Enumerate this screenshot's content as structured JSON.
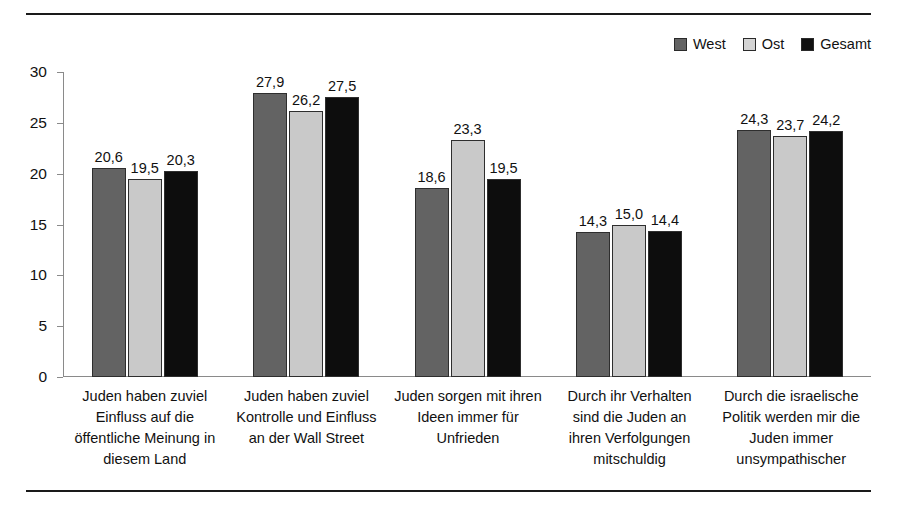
{
  "legend": {
    "position": "top-right",
    "entries": [
      {
        "label": "West",
        "color": "#636363",
        "name": "legend-west"
      },
      {
        "label": "Ost",
        "color": "#d4d4d4",
        "name": "legend-ost"
      },
      {
        "label": "Gesamt",
        "color": "#111111",
        "name": "legend-gesamt"
      }
    ]
  },
  "axis": {
    "y_ticks": [
      "0",
      "5",
      "10",
      "15",
      "20",
      "25",
      "30"
    ]
  },
  "chart_data": {
    "type": "bar",
    "title": "",
    "xlabel": "",
    "ylabel": "",
    "ylim": [
      0,
      30
    ],
    "ytick_step": 5,
    "grid": false,
    "legend_position": "top-right",
    "value_labels": true,
    "decimal_separator": ",",
    "categories": [
      "Juden haben zuviel Einfluss auf die öffentliche Meinung in diesem Land",
      "Juden haben zuviel Kontrolle und Einfluss an der Wall Street",
      "Juden sorgen mit ihren Ideen immer für Unfrieden",
      "Durch ihr Verhalten sind die Juden an ihren Verfolgungen mitschuldig",
      "Durch die israelische Politik werden mir die Juden immer unsympathischer"
    ],
    "category_lines": [
      [
        "Juden haben zuviel",
        "Einfluss auf die",
        "öffentliche Meinung in",
        "diesem Land"
      ],
      [
        "Juden haben zuviel",
        "Kontrolle und Einfluss",
        "an der Wall Street"
      ],
      [
        "Juden sorgen mit ihren",
        "Ideen immer für",
        "Unfrieden"
      ],
      [
        "Durch ihr Verhalten",
        "sind die Juden an",
        "ihren Verfolgungen",
        "mitschuldig"
      ],
      [
        "Durch die israelische",
        "Politik werden mir die",
        "Juden immer",
        "unsympathischer"
      ]
    ],
    "series": [
      {
        "name": "West",
        "color": "#636363",
        "values": [
          20.6,
          27.9,
          18.6,
          14.3,
          24.3
        ],
        "labels": [
          "20,6",
          "27,9",
          "18,6",
          "14,3",
          "24,3"
        ]
      },
      {
        "name": "Ost",
        "color": "#c9c9c9",
        "values": [
          19.5,
          26.2,
          23.3,
          15.0,
          23.7
        ],
        "labels": [
          "19,5",
          "26,2",
          "23,3",
          "15,0",
          "23,7"
        ]
      },
      {
        "name": "Gesamt",
        "color": "#0d0d0d",
        "values": [
          20.3,
          27.5,
          19.5,
          14.4,
          24.2
        ],
        "labels": [
          "20,3",
          "27,5",
          "19,5",
          "14,4",
          "24,2"
        ]
      }
    ]
  }
}
